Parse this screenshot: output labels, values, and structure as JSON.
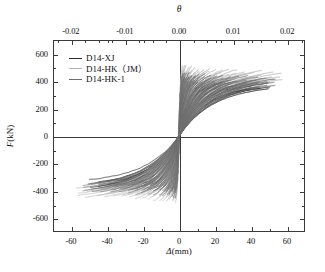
{
  "chart_data": {
    "type": "line",
    "title": "",
    "xlabel": "Δ(mm)",
    "ylabel": "F(kN)",
    "top_axis_label": "θ",
    "xlim": [
      -70,
      70
    ],
    "ylim": [
      -700,
      700
    ],
    "top_xlim": [
      -0.0233,
      0.0233
    ],
    "xticks": [
      -60,
      -40,
      -20,
      0,
      20,
      40,
      60
    ],
    "xticklabels": [
      "-60",
      "-40",
      "-20",
      "0",
      "20",
      "40",
      "60"
    ],
    "yticks": [
      600,
      400,
      200,
      0,
      -200,
      -400,
      -600
    ],
    "yticklabels": [
      "600",
      "400",
      "200",
      "0",
      "-200",
      "-400",
      "-600"
    ],
    "top_xticks": [
      -0.02,
      -0.01,
      0.0,
      0.01,
      0.02
    ],
    "top_xticklabels": [
      "-0.02",
      "-0.01",
      "0.00",
      "0.01",
      "0.02"
    ],
    "grid": false,
    "legend_position": "upper-left",
    "series": [
      {
        "name": "D14-XJ",
        "color": "#2a2a2a",
        "peak_positive_force": 430,
        "peak_negative_force": -415,
        "peak_positive_disp": 55,
        "peak_negative_disp": -52,
        "cycles": 30
      },
      {
        "name": "D14-HK（JM）",
        "color": "#b4b4b4",
        "peak_positive_force": 520,
        "peak_negative_force": -490,
        "peak_positive_disp": 60,
        "peak_negative_disp": -60,
        "cycles": 30
      },
      {
        "name": "D14-HK-1",
        "color": "#6e6e6e",
        "peak_positive_force": 470,
        "peak_negative_force": -450,
        "peak_positive_disp": 58,
        "peak_negative_disp": -56,
        "cycles": 30
      }
    ]
  }
}
